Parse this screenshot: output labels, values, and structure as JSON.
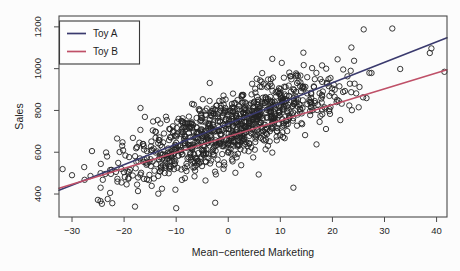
{
  "chart_data": {
    "type": "scatter",
    "title": "",
    "xlabel": "Mean−centered Marketing",
    "ylabel": "Sales",
    "x_ticks": [
      -30,
      -20,
      -10,
      0,
      10,
      20,
      30,
      40
    ],
    "y_ticks": [
      400,
      600,
      800,
      1000,
      1200
    ],
    "xlim": [
      -32.5,
      42.0
    ],
    "ylim": [
      290,
      1252
    ],
    "grid": false,
    "legend": {
      "position": "top-left",
      "entries": [
        {
          "label": "Toy A",
          "color": "#3a3a6e"
        },
        {
          "label": "Toy B",
          "color": "#bf5068"
        }
      ]
    },
    "lines": [
      {
        "name": "Toy A",
        "color": "#3a3a6e",
        "x": [
          -32.5,
          42.0
        ],
        "y": [
          418,
          1148
        ]
      },
      {
        "name": "Toy B",
        "color": "#bf5068",
        "x": [
          -32.5,
          42.0
        ],
        "y": [
          428,
          995
        ]
      }
    ],
    "scatter": {
      "n": 1000,
      "seed": 20,
      "x_mean": 0.8,
      "x_sd": 10.5,
      "x_range": [
        -31.8,
        41.8
      ],
      "y_model": {
        "intercept": 712,
        "slope": 9.3,
        "noise_sd": 80
      },
      "y_range": [
        335,
        1195
      ],
      "marker": {
        "shape": "open-circle",
        "radius_px": 2.7,
        "stroke": "#222222"
      },
      "notable_points": [
        {
          "x": 26,
          "y": 1188
        },
        {
          "x": 31.5,
          "y": 1192
        },
        {
          "x": 39,
          "y": 1097
        },
        {
          "x": 38.7,
          "y": 1075
        },
        {
          "x": 41.5,
          "y": 985
        },
        {
          "x": -30,
          "y": 490
        },
        {
          "x": -17.9,
          "y": 340
        },
        {
          "x": -10,
          "y": 332
        },
        {
          "x": -2.5,
          "y": 358
        },
        {
          "x": 12.5,
          "y": 430
        }
      ]
    }
  },
  "style": {
    "accent_blue": "#3a3a6e",
    "accent_red": "#bf5068",
    "axis_color": "#4a4a4a",
    "point_color": "#222222",
    "background": "#fcfcfc"
  }
}
